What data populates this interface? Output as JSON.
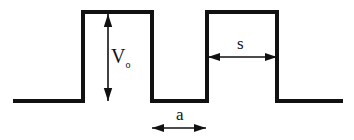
{
  "figure": {
    "background_color": "#ffffff",
    "line_color": "#111111",
    "line_width": 4,
    "dim_line_width": 1.6,
    "width": 354,
    "height": 140
  },
  "labels": {
    "barrier_height": {
      "name": "V",
      "base": "V",
      "subscript": "o",
      "text": "Vo",
      "x": 111,
      "y": 63,
      "font_size": 20
    },
    "well_width": {
      "name": "a",
      "text": "a",
      "x": 176,
      "y": 120,
      "font_size": 17
    },
    "barrier_width": {
      "name": "s",
      "text": "s",
      "x": 237,
      "y": 49,
      "font_size": 17
    }
  },
  "chart_data": {
    "type": "line",
    "xlabel": "",
    "ylabel": "",
    "baseline_y": 101,
    "top_y": 12,
    "series": [
      {
        "name": "potential-energy-profile",
        "points": [
          [
            13,
            101
          ],
          [
            83,
            101
          ],
          [
            83,
            12
          ],
          [
            152,
            12
          ],
          [
            152,
            101
          ],
          [
            207,
            101
          ],
          [
            207,
            12
          ],
          [
            277,
            12
          ],
          [
            277,
            101
          ],
          [
            343,
            101
          ]
        ]
      }
    ],
    "annotations": [
      {
        "name": "barrier-height-dimension",
        "label": "Vo",
        "orientation": "vertical",
        "x": 108,
        "y1": 14,
        "y2": 101,
        "arrowheads": "both"
      },
      {
        "name": "well-width-dimension",
        "label": "a",
        "orientation": "horizontal",
        "y": 128,
        "x1": 152,
        "x2": 206,
        "arrowheads": "both"
      },
      {
        "name": "barrier-width-dimension",
        "label": "s",
        "orientation": "horizontal",
        "y": 57,
        "x1": 208,
        "x2": 277,
        "arrowheads": "both"
      }
    ]
  }
}
